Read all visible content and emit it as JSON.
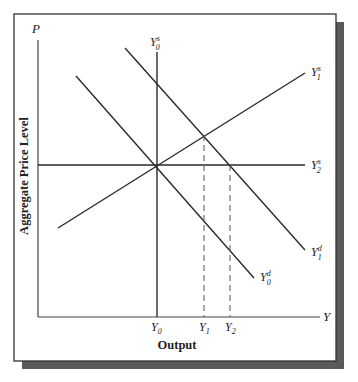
{
  "diagram": {
    "y_axis_symbol": "P",
    "x_axis_symbol": "Y",
    "y_axis_title": "Aggregate Price Level",
    "x_axis_title": "Output",
    "curves": [
      {
        "id": "Y0s",
        "base": "Y",
        "sub": "0",
        "sup": "s",
        "type": "supply-vertical"
      },
      {
        "id": "Y1s",
        "base": "Y",
        "sub": "1",
        "sup": "s",
        "type": "supply-upward"
      },
      {
        "id": "Y2s",
        "base": "Y",
        "sub": "2",
        "sup": "s",
        "type": "supply-horizontal"
      },
      {
        "id": "Y0d",
        "base": "Y",
        "sub": "0",
        "sup": "d",
        "type": "demand"
      },
      {
        "id": "Y1d",
        "base": "Y",
        "sub": "1",
        "sup": "d",
        "type": "demand"
      }
    ],
    "x_ticks": [
      {
        "base": "Y",
        "sub": "0"
      },
      {
        "base": "Y",
        "sub": "1"
      },
      {
        "base": "Y",
        "sub": "2"
      }
    ],
    "colors": {
      "line": "#2a2a2a",
      "frame": "#333333",
      "shadow": "#5a5a5a",
      "background": "#ffffff"
    }
  }
}
